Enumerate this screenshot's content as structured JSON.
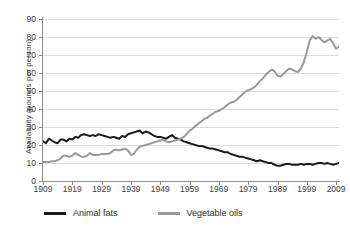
{
  "chart_data": {
    "type": "line",
    "title": "",
    "xlabel": "",
    "ylabel": "Availability (pounds per person)",
    "xlim": [
      1909,
      2010
    ],
    "ylim": [
      0,
      90
    ],
    "ytick_labels": [
      "0",
      "10",
      "20",
      "30",
      "40",
      "50",
      "60",
      "70",
      "80",
      "90"
    ],
    "ytick_values": [
      0,
      10,
      20,
      30,
      40,
      50,
      60,
      70,
      80,
      90
    ],
    "xtick_labels": [
      "1909",
      "1919",
      "1929",
      "1939",
      "1949",
      "1959",
      "1969",
      "1979",
      "1989",
      "1999",
      "2009"
    ],
    "xtick_values": [
      1909,
      1919,
      1929,
      1939,
      1949,
      1959,
      1969,
      1979,
      1989,
      1999,
      2009
    ],
    "grid": true,
    "legend_position": "bottom",
    "series": [
      {
        "name": "Animal fats",
        "color": "#1a1a1a",
        "x": [
          1909,
          1910,
          1911,
          1912,
          1913,
          1914,
          1915,
          1916,
          1917,
          1918,
          1919,
          1920,
          1921,
          1922,
          1923,
          1924,
          1925,
          1926,
          1927,
          1928,
          1929,
          1930,
          1931,
          1932,
          1933,
          1934,
          1935,
          1936,
          1937,
          1938,
          1939,
          1940,
          1941,
          1942,
          1943,
          1944,
          1945,
          1946,
          1947,
          1948,
          1949,
          1950,
          1951,
          1952,
          1953,
          1954,
          1955,
          1956,
          1957,
          1958,
          1959,
          1960,
          1961,
          1962,
          1963,
          1964,
          1965,
          1966,
          1967,
          1968,
          1969,
          1970,
          1971,
          1972,
          1973,
          1974,
          1975,
          1976,
          1977,
          1978,
          1979,
          1980,
          1981,
          1982,
          1983,
          1984,
          1985,
          1986,
          1987,
          1988,
          1989,
          1990,
          1991,
          1992,
          1993,
          1994,
          1995,
          1996,
          1997,
          1998,
          1999,
          2000,
          2001,
          2002,
          2003,
          2004,
          2005,
          2006,
          2007,
          2008,
          2009,
          2010
        ],
        "values": [
          22.0,
          21.0,
          23.5,
          22.5,
          21.5,
          21.0,
          23.0,
          23.0,
          22.0,
          23.5,
          23.0,
          24.5,
          24.0,
          25.5,
          26.0,
          25.5,
          25.0,
          25.5,
          25.0,
          26.0,
          25.5,
          25.0,
          24.5,
          24.0,
          24.5,
          24.0,
          23.5,
          25.0,
          24.5,
          26.0,
          26.5,
          27.0,
          27.5,
          28.0,
          26.5,
          27.5,
          27.0,
          26.0,
          25.0,
          24.5,
          24.5,
          24.0,
          23.5,
          24.5,
          25.5,
          24.0,
          23.5,
          23.0,
          22.0,
          21.5,
          21.0,
          20.5,
          20.0,
          19.5,
          19.5,
          19.0,
          18.5,
          18.0,
          18.0,
          17.5,
          17.0,
          16.5,
          16.0,
          16.0,
          15.0,
          14.5,
          14.0,
          13.5,
          13.5,
          13.0,
          12.5,
          12.0,
          11.5,
          11.0,
          11.5,
          11.0,
          10.5,
          10.0,
          10.0,
          9.0,
          8.5,
          8.5,
          9.0,
          9.5,
          9.5,
          9.0,
          9.0,
          9.0,
          9.5,
          9.0,
          9.5,
          9.5,
          9.0,
          9.5,
          10.0,
          10.0,
          9.5,
          10.0,
          9.5,
          9.0,
          9.5,
          10.0
        ]
      },
      {
        "name": "Vegetable oils",
        "color": "#9a9a9a",
        "x": [
          1909,
          1910,
          1911,
          1912,
          1913,
          1914,
          1915,
          1916,
          1917,
          1918,
          1919,
          1920,
          1921,
          1922,
          1923,
          1924,
          1925,
          1926,
          1927,
          1928,
          1929,
          1930,
          1931,
          1932,
          1933,
          1934,
          1935,
          1936,
          1937,
          1938,
          1939,
          1940,
          1941,
          1942,
          1943,
          1944,
          1945,
          1946,
          1947,
          1948,
          1949,
          1950,
          1951,
          1952,
          1953,
          1954,
          1955,
          1956,
          1957,
          1958,
          1959,
          1960,
          1961,
          1962,
          1963,
          1964,
          1965,
          1966,
          1967,
          1968,
          1969,
          1970,
          1971,
          1972,
          1973,
          1974,
          1975,
          1976,
          1977,
          1978,
          1979,
          1980,
          1981,
          1982,
          1983,
          1984,
          1985,
          1986,
          1987,
          1988,
          1989,
          1990,
          1991,
          1992,
          1993,
          1994,
          1995,
          1996,
          1997,
          1998,
          1999,
          2000,
          2001,
          2002,
          2003,
          2004,
          2005,
          2006,
          2007,
          2008,
          2009,
          2010
        ],
        "values": [
          10.5,
          10.5,
          10.5,
          11.0,
          11.0,
          11.5,
          12.5,
          14.0,
          14.0,
          13.5,
          14.0,
          15.5,
          14.5,
          13.5,
          13.5,
          14.0,
          15.5,
          14.5,
          14.5,
          14.5,
          15.0,
          15.0,
          15.0,
          15.5,
          17.0,
          17.5,
          17.0,
          17.5,
          18.0,
          17.0,
          14.5,
          15.0,
          17.5,
          19.0,
          19.5,
          20.0,
          20.5,
          21.0,
          21.5,
          22.0,
          22.5,
          23.0,
          22.0,
          21.5,
          22.0,
          22.5,
          23.0,
          23.5,
          24.5,
          26.0,
          28.0,
          29.0,
          30.5,
          32.0,
          33.0,
          34.5,
          35.0,
          36.5,
          37.5,
          38.5,
          39.0,
          40.0,
          41.0,
          42.5,
          43.5,
          44.0,
          45.0,
          46.5,
          48.0,
          49.5,
          50.5,
          51.0,
          52.0,
          53.5,
          55.5,
          57.0,
          59.0,
          60.5,
          62.0,
          61.0,
          58.5,
          58.0,
          59.5,
          61.0,
          62.5,
          62.0,
          61.0,
          60.5,
          62.5,
          66.0,
          71.5,
          78.0,
          80.5,
          79.0,
          80.0,
          78.5,
          77.0,
          78.0,
          79.0,
          76.5,
          73.5,
          74.5
        ]
      }
    ]
  },
  "legend": {
    "items": [
      {
        "label": "Animal fats",
        "color": "#1a1a1a"
      },
      {
        "label": "Vegetable oils",
        "color": "#9a9a9a"
      }
    ]
  }
}
